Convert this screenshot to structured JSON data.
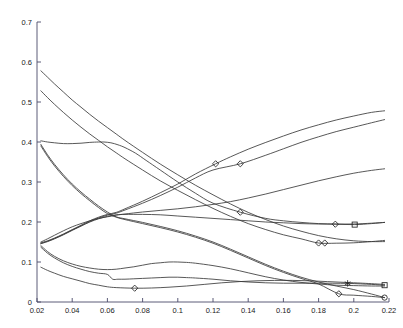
{
  "chart_data": {
    "type": "line",
    "title": "",
    "xlabel": "",
    "ylabel": "",
    "xlim": [
      0.02,
      0.22
    ],
    "ylim": [
      0.0,
      0.7
    ],
    "grid": false,
    "legend": "none",
    "background_color": "#ffffff",
    "line_color": "#3a3a3a",
    "axis_color": "#4a4a6a",
    "xticks": [
      0.02,
      0.04,
      0.06,
      0.08,
      0.1,
      0.12,
      0.14,
      0.16,
      0.18,
      0.2,
      0.22
    ],
    "xticklabels": [
      "0.02",
      "0.04",
      "0.06",
      "0.08",
      "0.1",
      "0.12",
      "0.14",
      "0.16",
      "0.18",
      "0.2",
      "0.22"
    ],
    "yticks": [
      0,
      0.1,
      0.2,
      0.3,
      0.4,
      0.5,
      0.6,
      0.7
    ],
    "yticklabels": [
      "0",
      "0.1",
      "0.2",
      "0.3",
      "0.4",
      "0.5",
      "0.6",
      "0.7"
    ],
    "series": [
      {
        "name": "curve-1-upper-decreasing",
        "marker": "none",
        "x": [
          0.0222,
          0.026,
          0.03,
          0.035,
          0.04,
          0.045,
          0.05,
          0.055,
          0.06,
          0.065,
          0.07,
          0.08,
          0.09,
          0.1,
          0.11,
          0.12,
          0.13,
          0.14,
          0.15,
          0.16,
          0.17,
          0.18,
          0.19,
          0.2,
          0.21,
          0.2175
        ],
        "y": [
          0.578,
          0.562,
          0.545,
          0.525,
          0.505,
          0.487,
          0.469,
          0.452,
          0.436,
          0.42,
          0.404,
          0.374,
          0.345,
          0.318,
          0.292,
          0.268,
          0.245,
          0.224,
          0.206,
          0.19,
          0.177,
          0.166,
          0.158,
          0.153,
          0.151,
          0.151
        ]
      },
      {
        "name": "curve-2-second-decreasing",
        "marker": "diamond",
        "marker_points": [
          [
            0.18,
            0.1475
          ],
          [
            0.1835,
            0.1475
          ]
        ],
        "x": [
          0.0222,
          0.026,
          0.03,
          0.035,
          0.04,
          0.045,
          0.05,
          0.055,
          0.06,
          0.065,
          0.07,
          0.08,
          0.09,
          0.1,
          0.11,
          0.12,
          0.13,
          0.14,
          0.15,
          0.16,
          0.17,
          0.18,
          0.19,
          0.2,
          0.21,
          0.2175
        ],
        "y": [
          0.528,
          0.511,
          0.494,
          0.474,
          0.455,
          0.437,
          0.42,
          0.404,
          0.388,
          0.373,
          0.358,
          0.33,
          0.303,
          0.279,
          0.256,
          0.234,
          0.214,
          0.196,
          0.181,
          0.168,
          0.158,
          0.1475,
          0.147,
          0.148,
          0.151,
          0.154
        ]
      },
      {
        "name": "curve-3-plateau-decreasing",
        "marker": "diamond",
        "marker_points": [
          [
            0.1355,
            0.2245
          ]
        ],
        "x": [
          0.0222,
          0.026,
          0.03,
          0.035,
          0.04,
          0.045,
          0.05,
          0.055,
          0.058,
          0.062,
          0.066,
          0.07,
          0.076,
          0.082,
          0.09,
          0.1,
          0.11,
          0.12,
          0.1355,
          0.15,
          0.16,
          0.17,
          0.18,
          0.19,
          0.2,
          0.21,
          0.2175
        ],
        "y": [
          0.403,
          0.4,
          0.398,
          0.396,
          0.396,
          0.397,
          0.399,
          0.4,
          0.4,
          0.398,
          0.393,
          0.386,
          0.372,
          0.354,
          0.33,
          0.3,
          0.272,
          0.247,
          0.2245,
          0.209,
          0.203,
          0.199,
          0.196,
          0.195,
          0.195,
          0.197,
          0.199
        ]
      },
      {
        "name": "curve-4-steep-decreasing",
        "marker": "none",
        "x": [
          0.0222,
          0.026,
          0.03,
          0.035,
          0.04,
          0.045,
          0.05,
          0.055,
          0.06,
          0.065,
          0.07,
          0.08,
          0.09,
          0.1,
          0.11,
          0.12,
          0.13,
          0.14,
          0.15,
          0.16,
          0.17,
          0.18,
          0.19,
          0.2,
          0.21,
          0.2175
        ],
        "y": [
          0.394,
          0.368,
          0.344,
          0.318,
          0.295,
          0.275,
          0.257,
          0.24,
          0.225,
          0.213,
          0.208,
          0.199,
          0.189,
          0.178,
          0.165,
          0.15,
          0.132,
          0.113,
          0.094,
          0.077,
          0.062,
          0.05,
          0.04,
          0.031,
          0.02,
          0.011
        ]
      },
      {
        "name": "curve-5-steep-decreasing-b",
        "marker": "diamond",
        "marker_points": [
          [
            0.1915,
            0.0205
          ]
        ],
        "x": [
          0.0222,
          0.026,
          0.03,
          0.035,
          0.04,
          0.045,
          0.05,
          0.055,
          0.06,
          0.065,
          0.07,
          0.08,
          0.09,
          0.1,
          0.11,
          0.12,
          0.13,
          0.14,
          0.15,
          0.16,
          0.17,
          0.18,
          0.1915,
          0.2,
          0.21,
          0.2175
        ],
        "y": [
          0.39,
          0.364,
          0.34,
          0.314,
          0.291,
          0.271,
          0.253,
          0.236,
          0.221,
          0.212,
          0.206,
          0.196,
          0.186,
          0.175,
          0.162,
          0.147,
          0.129,
          0.11,
          0.091,
          0.074,
          0.059,
          0.045,
          0.0205,
          0.017,
          0.014,
          0.011
        ]
      },
      {
        "name": "curve-6-rising-upper",
        "marker": "diamond",
        "marker_points": [
          [
            0.1215,
            0.3455
          ]
        ],
        "x": [
          0.0222,
          0.026,
          0.03,
          0.035,
          0.04,
          0.045,
          0.05,
          0.055,
          0.06,
          0.065,
          0.07,
          0.08,
          0.09,
          0.1,
          0.11,
          0.1215,
          0.13,
          0.14,
          0.15,
          0.16,
          0.17,
          0.18,
          0.19,
          0.2,
          0.21,
          0.2175
        ],
        "y": [
          0.148,
          0.153,
          0.16,
          0.17,
          0.181,
          0.192,
          0.203,
          0.212,
          0.219,
          0.224,
          0.233,
          0.252,
          0.273,
          0.295,
          0.32,
          0.3455,
          0.363,
          0.382,
          0.399,
          0.415,
          0.43,
          0.443,
          0.455,
          0.465,
          0.474,
          0.478
        ]
      },
      {
        "name": "curve-7-rising-lower",
        "marker": "diamond",
        "marker_points": [
          [
            0.1355,
            0.3455
          ]
        ],
        "x": [
          0.0222,
          0.026,
          0.03,
          0.035,
          0.04,
          0.045,
          0.05,
          0.055,
          0.06,
          0.065,
          0.07,
          0.08,
          0.09,
          0.1,
          0.11,
          0.12,
          0.1355,
          0.15,
          0.16,
          0.17,
          0.18,
          0.19,
          0.2,
          0.21,
          0.2175
        ],
        "y": [
          0.146,
          0.151,
          0.158,
          0.168,
          0.179,
          0.19,
          0.201,
          0.21,
          0.217,
          0.222,
          0.23,
          0.247,
          0.266,
          0.287,
          0.31,
          0.33,
          0.3455,
          0.367,
          0.383,
          0.399,
          0.413,
          0.426,
          0.437,
          0.448,
          0.456
        ]
      },
      {
        "name": "curve-8-rising-mid",
        "marker": "none",
        "x": [
          0.0222,
          0.026,
          0.03,
          0.035,
          0.04,
          0.045,
          0.05,
          0.055,
          0.06,
          0.065,
          0.07,
          0.08,
          0.09,
          0.1,
          0.11,
          0.12,
          0.13,
          0.14,
          0.15,
          0.16,
          0.17,
          0.18,
          0.19,
          0.2,
          0.21,
          0.2175
        ],
        "y": [
          0.15,
          0.158,
          0.167,
          0.178,
          0.188,
          0.196,
          0.203,
          0.209,
          0.213,
          0.217,
          0.22,
          0.225,
          0.229,
          0.233,
          0.238,
          0.244,
          0.251,
          0.26,
          0.27,
          0.281,
          0.292,
          0.303,
          0.313,
          0.322,
          0.329,
          0.333
        ]
      },
      {
        "name": "curve-9-shallow-u",
        "marker": "diamond-square",
        "marker_points": [
          [
            0.1895,
            0.1945
          ],
          [
            0.2005,
            0.1935
          ]
        ],
        "x": [
          0.0222,
          0.026,
          0.03,
          0.035,
          0.04,
          0.045,
          0.05,
          0.055,
          0.06,
          0.065,
          0.07,
          0.08,
          0.09,
          0.1,
          0.11,
          0.12,
          0.13,
          0.14,
          0.15,
          0.16,
          0.17,
          0.18,
          0.1895,
          0.2005,
          0.21,
          0.2175
        ],
        "y": [
          0.146,
          0.152,
          0.159,
          0.169,
          0.18,
          0.19,
          0.2,
          0.208,
          0.214,
          0.218,
          0.219,
          0.219,
          0.218,
          0.215,
          0.212,
          0.209,
          0.206,
          0.203,
          0.2,
          0.198,
          0.196,
          0.195,
          0.1945,
          0.1935,
          0.196,
          0.199
        ]
      },
      {
        "name": "curve-10-lower-bump-a",
        "marker": "none",
        "x": [
          0.0222,
          0.026,
          0.03,
          0.035,
          0.04,
          0.045,
          0.05,
          0.055,
          0.06,
          0.065,
          0.07,
          0.075,
          0.08,
          0.085,
          0.09,
          0.095,
          0.1,
          0.105,
          0.11,
          0.12,
          0.13,
          0.14,
          0.15,
          0.16,
          0.17,
          0.18,
          0.19,
          0.2,
          0.21,
          0.2175
        ],
        "y": [
          0.141,
          0.126,
          0.114,
          0.103,
          0.095,
          0.089,
          0.085,
          0.082,
          0.081,
          0.082,
          0.085,
          0.088,
          0.092,
          0.096,
          0.098,
          0.1,
          0.1,
          0.099,
          0.097,
          0.091,
          0.083,
          0.073,
          0.063,
          0.055,
          0.049,
          0.045,
          0.042,
          0.041,
          0.04,
          0.04
        ]
      },
      {
        "name": "curve-11-lower-bump-b",
        "marker": "star",
        "marker_points": [
          [
            0.1965,
            0.0465
          ]
        ],
        "x": [
          0.0222,
          0.026,
          0.03,
          0.035,
          0.04,
          0.045,
          0.05,
          0.055,
          0.06,
          0.063,
          0.066,
          0.07,
          0.075,
          0.08,
          0.085,
          0.09,
          0.095,
          0.1,
          0.105,
          0.11,
          0.12,
          0.13,
          0.14,
          0.15,
          0.16,
          0.17,
          0.18,
          0.1965,
          0.21,
          0.2175
        ],
        "y": [
          0.137,
          0.122,
          0.11,
          0.098,
          0.089,
          0.082,
          0.076,
          0.072,
          0.069,
          0.057,
          0.057,
          0.057,
          0.058,
          0.059,
          0.06,
          0.061,
          0.062,
          0.062,
          0.061,
          0.06,
          0.057,
          0.053,
          0.05,
          0.048,
          0.047,
          0.047,
          0.047,
          0.0465,
          0.044,
          0.042
        ]
      },
      {
        "name": "curve-12-bottom-diamond",
        "marker": "diamond",
        "marker_points": [
          [
            0.0755,
            0.0345
          ]
        ],
        "x": [
          0.0222,
          0.026,
          0.03,
          0.035,
          0.04,
          0.045,
          0.05,
          0.055,
          0.06,
          0.065,
          0.0755,
          0.085,
          0.095,
          0.105,
          0.115,
          0.125,
          0.135,
          0.145,
          0.155,
          0.165,
          0.175,
          0.185,
          0.195,
          0.205,
          0.2175
        ],
        "y": [
          0.087,
          0.079,
          0.072,
          0.064,
          0.058,
          0.052,
          0.046,
          0.042,
          0.038,
          0.036,
          0.0345,
          0.035,
          0.037,
          0.04,
          0.044,
          0.048,
          0.051,
          0.053,
          0.054,
          0.054,
          0.053,
          0.051,
          0.049,
          0.047,
          0.044
        ]
      }
    ],
    "markers": [
      {
        "shape": "diamond",
        "x": 0.1215,
        "y": 0.3455
      },
      {
        "shape": "diamond",
        "x": 0.1355,
        "y": 0.3455
      },
      {
        "shape": "diamond",
        "x": 0.1355,
        "y": 0.2245
      },
      {
        "shape": "diamond",
        "x": 0.1895,
        "y": 0.1945
      },
      {
        "shape": "square",
        "x": 0.2005,
        "y": 0.1935
      },
      {
        "shape": "diamond",
        "x": 0.18,
        "y": 0.1475
      },
      {
        "shape": "diamond",
        "x": 0.1835,
        "y": 0.1475
      },
      {
        "shape": "star",
        "x": 0.1965,
        "y": 0.0465
      },
      {
        "shape": "diamond",
        "x": 0.1915,
        "y": 0.0205
      },
      {
        "shape": "diamond",
        "x": 0.0755,
        "y": 0.0345
      },
      {
        "shape": "square",
        "x": 0.2175,
        "y": 0.042
      },
      {
        "shape": "circle",
        "x": 0.2175,
        "y": 0.011
      }
    ]
  },
  "figure": {
    "plot_left_px": 37,
    "plot_right_px": 389,
    "plot_top_px": 22,
    "plot_bottom_px": 302
  }
}
